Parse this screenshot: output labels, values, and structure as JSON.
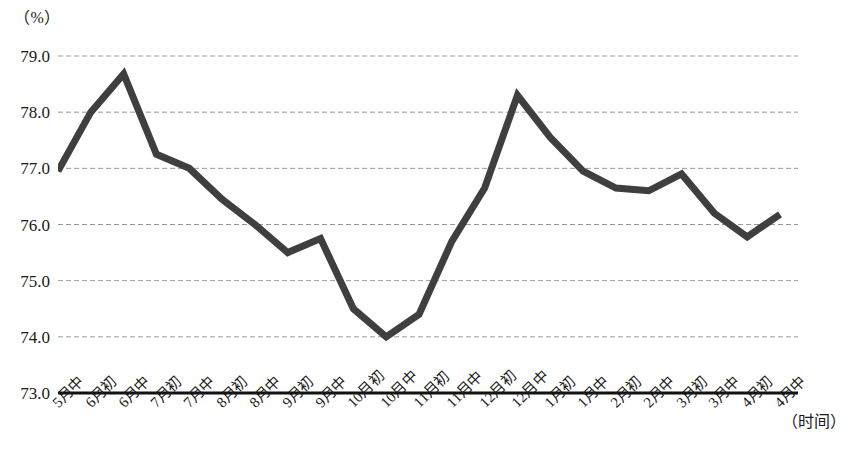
{
  "axes": {
    "y_unit_label": "（%）",
    "x_axis_title": "（时间）"
  },
  "chart_data": {
    "type": "line",
    "title": "",
    "subtitle": "",
    "xlabel": "（时间）",
    "ylabel": "（%）",
    "ylim": [
      73.0,
      79.0
    ],
    "ytick_labels": [
      "79.0",
      "78.0",
      "77.0",
      "76.0",
      "75.0",
      "74.0",
      "73.0"
    ],
    "yticks": [
      79.0,
      78.0,
      77.0,
      76.0,
      75.0,
      74.0,
      73.0
    ],
    "grid": true,
    "grid_style": "dashed",
    "legend": "none",
    "line_color": "#3f3f3f",
    "line_width": 7,
    "categories": [
      "5月中",
      "6月初",
      "6月中",
      "7月初",
      "7月中",
      "8月初",
      "8月中",
      "9月初",
      "9月中",
      "10月初",
      "10月中",
      "11月初",
      "11月中",
      "12月初",
      "12月中",
      "1月初",
      "1月中",
      "2月初",
      "2月中",
      "3月初",
      "3月中",
      "4月初",
      "4月中"
    ],
    "values": [
      76.95,
      78.0,
      78.68,
      77.25,
      77.0,
      76.45,
      76.0,
      75.5,
      75.75,
      74.5,
      74.0,
      74.4,
      75.7,
      76.65,
      78.3,
      77.55,
      76.95,
      76.65,
      76.6,
      76.9,
      76.2,
      75.78,
      76.18
    ],
    "series": [
      {
        "name": "",
        "values": [
          76.95,
          78.0,
          78.68,
          77.25,
          77.0,
          76.45,
          76.0,
          75.5,
          75.75,
          74.5,
          74.0,
          74.4,
          75.7,
          76.65,
          78.3,
          77.55,
          76.95,
          76.65,
          76.6,
          76.9,
          76.2,
          75.78,
          76.18
        ]
      }
    ]
  }
}
